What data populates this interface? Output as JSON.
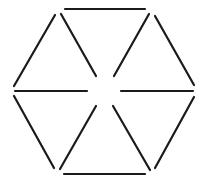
{
  "diagram": {
    "type": "matchstick-hexagon",
    "width": 204,
    "height": 188,
    "background": "#ffffff",
    "stroke_color": "#1a1a1a",
    "stroke_width": 2.2,
    "sticks": [
      {
        "id": "top-edge",
        "role": "outer",
        "x1": 65,
        "y1": 9,
        "x2": 145,
        "y2": 9
      },
      {
        "id": "upper-left-edge",
        "role": "outer",
        "x1": 55,
        "y1": 15,
        "x2": 14,
        "y2": 86
      },
      {
        "id": "upper-right-edge",
        "role": "outer",
        "x1": 155,
        "y1": 16,
        "x2": 194,
        "y2": 85
      },
      {
        "id": "lower-left-edge",
        "role": "outer",
        "x1": 14,
        "y1": 96,
        "x2": 54,
        "y2": 168
      },
      {
        "id": "lower-right-edge",
        "role": "outer",
        "x1": 194,
        "y1": 97,
        "x2": 155,
        "y2": 168
      },
      {
        "id": "bottom-edge",
        "role": "outer",
        "x1": 64,
        "y1": 174,
        "x2": 145,
        "y2": 174
      },
      {
        "id": "upper-left-spoke",
        "role": "inner",
        "x1": 61,
        "y1": 14,
        "x2": 96,
        "y2": 76
      },
      {
        "id": "upper-right-spoke",
        "role": "inner",
        "x1": 149,
        "y1": 14,
        "x2": 114,
        "y2": 76
      },
      {
        "id": "left-spoke",
        "role": "inner",
        "x1": 15,
        "y1": 91,
        "x2": 87,
        "y2": 91
      },
      {
        "id": "right-spoke",
        "role": "inner",
        "x1": 121,
        "y1": 91,
        "x2": 193,
        "y2": 91
      },
      {
        "id": "lower-left-spoke",
        "role": "inner",
        "x1": 96,
        "y1": 106,
        "x2": 60,
        "y2": 169
      },
      {
        "id": "lower-right-spoke",
        "role": "inner",
        "x1": 113,
        "y1": 106,
        "x2": 150,
        "y2": 170
      }
    ],
    "stick_count": 12,
    "triangle_count": 6
  }
}
